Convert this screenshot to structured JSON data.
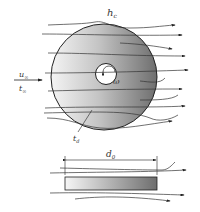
{
  "diagram": {
    "labels": {
      "heat_transfer_coeff": "h",
      "heat_transfer_coeff_sub": "c",
      "free_stream_velocity": "u",
      "free_stream_velocity_sub": "∞",
      "free_stream_temp": "t",
      "free_stream_temp_sub": "∞",
      "angular_velocity": "ω",
      "disk_temp": "t",
      "disk_temp_sub": "d",
      "diameter": "d",
      "diameter_sub": "0"
    },
    "views": [
      "top-view",
      "side-view"
    ],
    "colors": {
      "stroke": "#222222",
      "gradient_light": "#f4f4f4",
      "gradient_dark": "#6e6e6e"
    }
  }
}
